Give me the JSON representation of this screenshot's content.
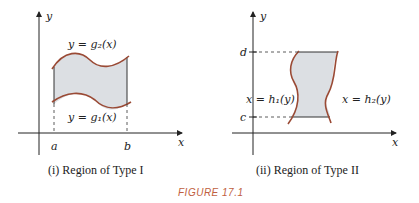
{
  "figure_label": "FIGURE 17.1",
  "colors": {
    "curve": "#9a4a35",
    "fill": "#dcdfe3",
    "axis": "#222222",
    "figure_label": "#c06040"
  },
  "panel1": {
    "caption": "(i)  Region of Type I",
    "axis_x": "x",
    "axis_y": "y",
    "tick_a": "a",
    "tick_b": "b",
    "upper_curve_label": "y = g₂(x)",
    "lower_curve_label": "y = g₁(x)"
  },
  "panel2": {
    "caption": "(ii)  Region of Type II",
    "axis_x": "x",
    "axis_y": "y",
    "tick_c": "c",
    "tick_d": "d",
    "left_curve_label": "x = h₁(y)",
    "right_curve_label": "x = h₂(y)"
  }
}
